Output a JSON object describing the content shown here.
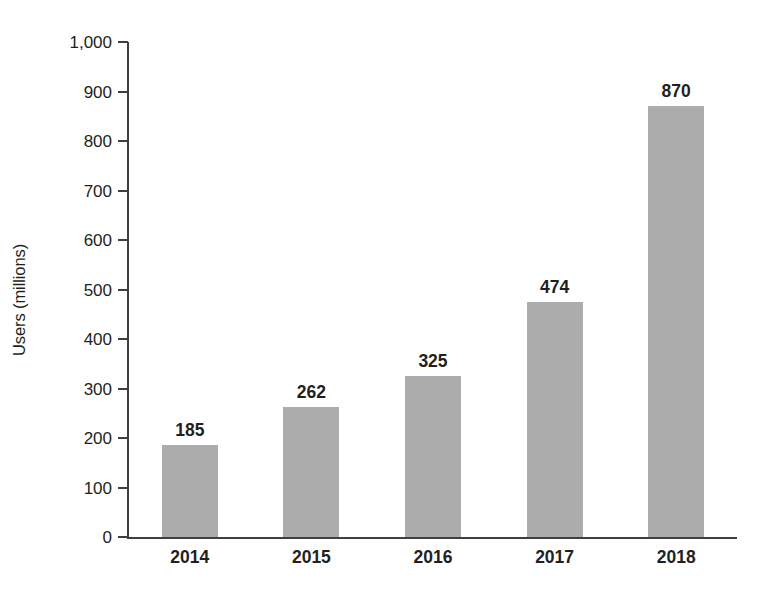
{
  "chart_data": {
    "type": "bar",
    "title": "",
    "subtitle": "",
    "xlabel": "",
    "ylabel": "Users (millions)",
    "categories": [
      "2014",
      "2015",
      "2016",
      "2017",
      "2018"
    ],
    "values": [
      185,
      262,
      325,
      474,
      870
    ],
    "data_labels": [
      "185",
      "262",
      "325",
      "474",
      "870"
    ],
    "ylim": [
      0,
      1000
    ],
    "ytick_values": [
      0,
      100,
      200,
      300,
      400,
      500,
      600,
      700,
      800,
      900,
      1000
    ],
    "ytick_labels": [
      "0",
      "100",
      "200",
      "300",
      "400",
      "500",
      "600",
      "700",
      "800",
      "900",
      "1,000"
    ],
    "grid": false,
    "legend": null,
    "legend_position": "none",
    "series": [
      {
        "name": "Users",
        "values": [
          185,
          262,
          325,
          474,
          870
        ]
      }
    ],
    "colors": {
      "bar_fill": "#acacac",
      "axis": "#3f3f3f",
      "text": "#231f20",
      "background": "#ffffff"
    }
  }
}
